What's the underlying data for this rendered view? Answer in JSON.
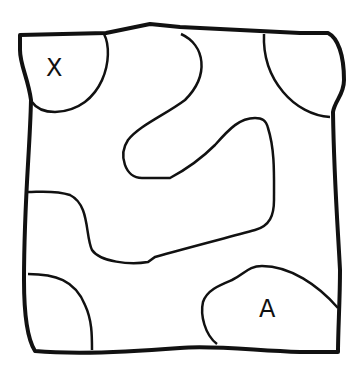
{
  "diagram": {
    "stroke_color": "#111111",
    "background": "#ffffff",
    "labels": [
      {
        "id": "start",
        "text": "X",
        "x": 57,
        "y": 74
      },
      {
        "id": "end",
        "text": "A",
        "x": 270,
        "y": 318
      }
    ]
  }
}
